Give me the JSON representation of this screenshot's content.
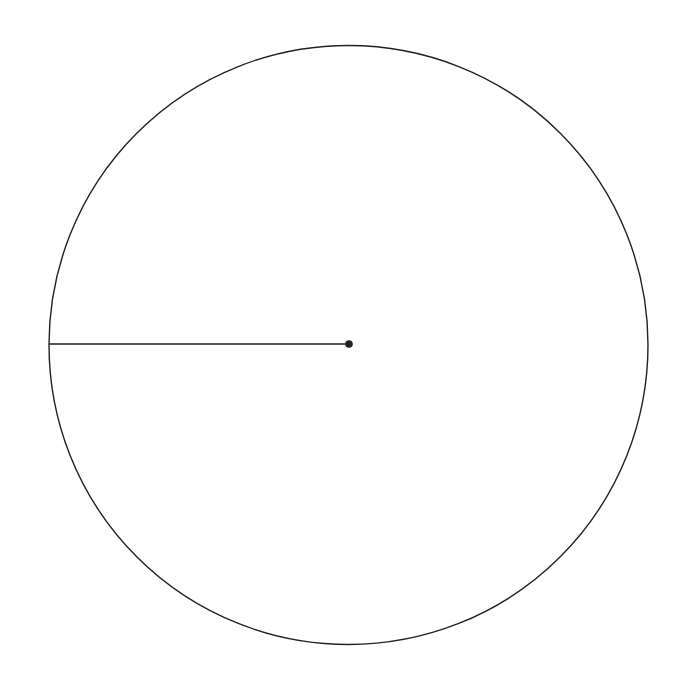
{
  "diagram": {
    "type": "geometry",
    "stroke_color": "#222222",
    "background": "#ffffff",
    "circle": {
      "cx": 348.5,
      "cy": 345,
      "r": 299.5,
      "stroke_width": 1.4
    },
    "center_point": {
      "cx": 349,
      "cy": 344,
      "r": 3.8
    },
    "radius_segment": {
      "x1": 49,
      "y1": 344,
      "x2": 349,
      "y2": 344,
      "stroke_width": 1.4
    }
  }
}
